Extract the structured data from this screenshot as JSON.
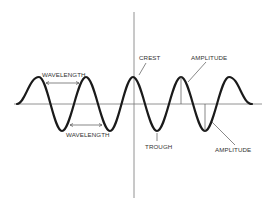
{
  "diagram": {
    "title": "",
    "labels": {
      "wavelength_top": "WAVELENGTH",
      "wavelength_bottom": "WAVELENGTH",
      "crest": "CREST",
      "trough": "TROUGH",
      "amplitude_top": "AMPLITUDE",
      "amplitude_bottom": "AMPLITUDE"
    },
    "colors": {
      "wave": "#1a1a1a",
      "axis": "#777777",
      "annotation": "#555555",
      "text": "#333333",
      "background": "#ffffff"
    },
    "wave": {
      "baseline_y": 104,
      "amplitude_px": 27,
      "crest_x": [
        39,
        86,
        133,
        181,
        229
      ],
      "trough_x": [
        62,
        110,
        157,
        205
      ],
      "start_x": 17,
      "end_x": 252
    }
  }
}
